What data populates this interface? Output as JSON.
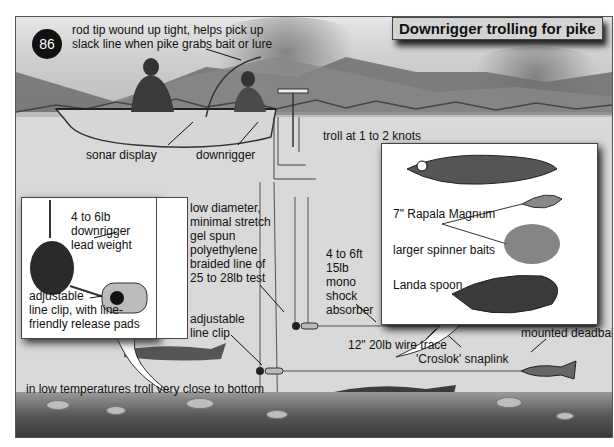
{
  "figure": {
    "number": "86",
    "title": "Downrigger trolling for pike"
  },
  "labels": {
    "rod_tip": [
      "rod tip wound up tight, helps pick up",
      "slack line when pike grabs bait or lure"
    ],
    "sonar_display": "sonar display",
    "downrigger": "downrigger",
    "troll_speed": "troll at 1 to 2 knots",
    "lead_weight": [
      "4 to 6lb",
      "downrigger",
      "lead weight"
    ],
    "adjustable_clip_inset": [
      "adjustable",
      "line clip, with line-",
      "friendly release pads"
    ],
    "braided_line": [
      "low diameter,",
      "minimal stretch",
      "gel spun",
      "polyethylene",
      "braided line of",
      "25 to 28lb test"
    ],
    "adjustable_clip": [
      "adjustable",
      "line clip"
    ],
    "shock_absorber": [
      "4 to 6ft",
      "15lb",
      "mono",
      "shock",
      "absorber"
    ],
    "wire_trace": "12\" 20lb wire trace",
    "snaplink": "'Croslok' snaplink",
    "mounted_deadbait": "mounted deadbait",
    "low_temp_note": "in low temperatures troll very close to bottom"
  },
  "lures": [
    {
      "name": "7\" Rapala Magnum"
    },
    {
      "name": "larger spinner baits"
    },
    {
      "name": "Landa spoon"
    }
  ],
  "colors": {
    "badge_bg": "#111111",
    "title_bg": "#d3d3d3",
    "ink": "#111111"
  }
}
